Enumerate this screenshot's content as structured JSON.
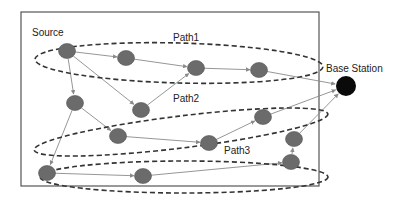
{
  "diagram": {
    "type": "wsn-multipath-routing",
    "colors": {
      "node": "#6b6b6b",
      "node_stroke": "#555555",
      "base_station": "#0a0a0a",
      "edge": "#8a8a8a",
      "ellipse": "#333333",
      "frame": "#555555"
    },
    "frame": {
      "x": 21,
      "y": 12,
      "w": 298,
      "h": 174
    },
    "labels": {
      "source": "Source",
      "base_station": "Base Station",
      "path1": "Path1",
      "path2": "Path2",
      "path3": "Path3"
    },
    "nodes": [
      {
        "id": "source",
        "x": 67,
        "y": 51
      },
      {
        "id": "n2",
        "x": 126,
        "y": 58
      },
      {
        "id": "n3",
        "x": 196,
        "y": 68
      },
      {
        "id": "n4",
        "x": 259,
        "y": 70
      },
      {
        "id": "n5",
        "x": 75,
        "y": 103
      },
      {
        "id": "n6",
        "x": 141,
        "y": 110
      },
      {
        "id": "n7",
        "x": 118,
        "y": 136
      },
      {
        "id": "n8",
        "x": 209,
        "y": 143
      },
      {
        "id": "n9",
        "x": 263,
        "y": 117
      },
      {
        "id": "n10",
        "x": 294,
        "y": 139
      },
      {
        "id": "n11",
        "x": 291,
        "y": 162
      },
      {
        "id": "n12",
        "x": 47,
        "y": 173
      },
      {
        "id": "n13",
        "x": 143,
        "y": 176
      }
    ],
    "base_station": {
      "id": "bs",
      "x": 346,
      "y": 86,
      "r": 10
    },
    "edges": [
      [
        "source",
        "n2"
      ],
      [
        "source",
        "n5"
      ],
      [
        "source",
        "n6"
      ],
      [
        "n2",
        "n3"
      ],
      [
        "n3",
        "n4"
      ],
      [
        "n4",
        "bs"
      ],
      [
        "n6",
        "n3"
      ],
      [
        "n5",
        "n7"
      ],
      [
        "n5",
        "n12"
      ],
      [
        "n7",
        "n8"
      ],
      [
        "n8",
        "n9"
      ],
      [
        "n9",
        "bs"
      ],
      [
        "n12",
        "n13"
      ],
      [
        "n13",
        "n11"
      ],
      [
        "n11",
        "n10"
      ],
      [
        "n10",
        "bs"
      ]
    ],
    "paths": [
      {
        "name": "Path1",
        "cx": 179,
        "cy": 63,
        "rx": 144,
        "ry": 20,
        "rot": 1.5
      },
      {
        "name": "Path2",
        "cx": 181,
        "cy": 132,
        "rx": 148,
        "ry": 16,
        "rot": -7
      },
      {
        "name": "Path3",
        "cx": 184,
        "cy": 177,
        "rx": 144,
        "ry": 16,
        "rot": 0
      }
    ]
  }
}
